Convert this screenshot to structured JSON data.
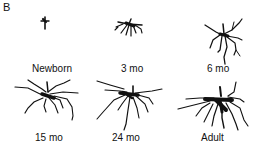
{
  "figure": {
    "panel_letter": "B",
    "stages": [
      {
        "label": "Newborn"
      },
      {
        "label": "3 mo"
      },
      {
        "label": "6 mo"
      },
      {
        "label": "15 mo"
      },
      {
        "label": "24 mo"
      },
      {
        "label": "Adult"
      }
    ]
  }
}
